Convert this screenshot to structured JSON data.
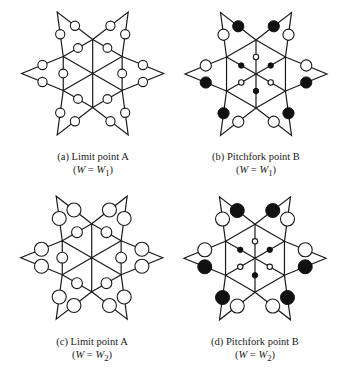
{
  "figure": {
    "panels": [
      {
        "id": "a",
        "label": "(a) Limit point A",
        "condition_prefix": "(",
        "condition_var": "W",
        "condition_eq": " = ",
        "condition_val": "W",
        "condition_sub": "1",
        "condition_suffix": ")",
        "center": [
          92.7,
          73.5
        ],
        "caption_y": 150,
        "circle_placement": "hex-edges",
        "tip_radius": 4.6,
        "inner_radius": 4.4,
        "tip_states": [
          "open",
          "open",
          "open",
          "open",
          "open",
          "open",
          "open",
          "open",
          "open",
          "open",
          "open",
          "open"
        ],
        "inner_states": [
          "open",
          "open",
          "open",
          "open",
          "open",
          "open"
        ]
      },
      {
        "id": "b",
        "label": "(b) Pitchfork point B",
        "condition_prefix": "(",
        "condition_var": "W",
        "condition_eq": " = ",
        "condition_val": "W",
        "condition_sub": "1",
        "condition_suffix": ")",
        "center": [
          256,
          74
        ],
        "caption_y": 150,
        "circle_placement": "spokes",
        "tip_radius": 5.6,
        "inner_radius": 2.7,
        "tip_states": [
          "filled",
          "open",
          "open",
          "filled",
          "filled",
          "open",
          "open",
          "filled",
          "filled",
          "open",
          "open",
          "filled"
        ],
        "inner_states": [
          "open",
          "filled",
          "open",
          "filled",
          "open",
          "filled"
        ]
      },
      {
        "id": "c",
        "label": "(c) Limit point A",
        "condition_prefix": "(",
        "condition_var": "W",
        "condition_eq": " = ",
        "condition_val": "W",
        "condition_sub": "2",
        "condition_suffix": ")",
        "center": [
          91.7,
          257.7
        ],
        "caption_y": 335,
        "circle_placement": "hex-edges",
        "tip_radius": 7.0,
        "inner_radius": 5.4,
        "tip_states": [
          "open",
          "open",
          "open",
          "open",
          "open",
          "open",
          "open",
          "open",
          "open",
          "open",
          "open",
          "open"
        ],
        "inner_states": [
          "open",
          "open",
          "open",
          "open",
          "open",
          "open"
        ]
      },
      {
        "id": "d",
        "label": "(d) Pitchfork point B",
        "condition_prefix": "(",
        "condition_var": "W",
        "condition_eq": " = ",
        "condition_val": "W",
        "condition_sub": "2",
        "condition_suffix": ")",
        "center": [
          255,
          258.3
        ],
        "caption_y": 335,
        "circle_placement": "spokes",
        "tip_radius": 7.0,
        "inner_radius": 2.7,
        "tip_states": [
          "filled",
          "open",
          "open",
          "filled",
          "filled",
          "open",
          "open",
          "filled",
          "filled",
          "open",
          "open",
          "filled"
        ],
        "inner_states": [
          "open",
          "filled",
          "open",
          "filled",
          "open",
          "filled"
        ]
      }
    ],
    "geometry": {
      "hex_radius": 34,
      "tip_distance": 71
    },
    "colors": {
      "line": "#1a1a1a",
      "fill_dark": "#111111",
      "fill_light": "#ffffff"
    }
  }
}
